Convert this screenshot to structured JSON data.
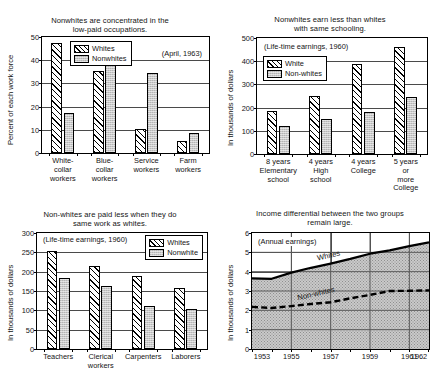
{
  "page": {
    "background": "#ffffff",
    "ink": "#000000",
    "shade": "#c9c9c9"
  },
  "charts": [
    {
      "id": "occupations",
      "chart_data": {
        "type": "bar",
        "title": "Nonwhites are concentrated in the\nlow-paid occupations.",
        "title_line1": "Nonwhites are concentrated in the",
        "title_line2": "low-paid occupations.",
        "note": "(April, 1963)",
        "xlabel": "",
        "ylabel": "Percent of each work force",
        "ylim": [
          0,
          50
        ],
        "yticks": [
          0,
          10,
          20,
          30,
          40,
          50
        ],
        "ytick_labels": [
          "0",
          "10",
          "20",
          "30",
          "40",
          "50"
        ],
        "grid": true,
        "legend_position": "inside-top-left",
        "categories": [
          "White-\ncollar\nworkers",
          "Blue-\ncollar\nworkers",
          "Service\nworkers",
          "Farm\nworkers"
        ],
        "series": [
          {
            "name": "Whites",
            "pattern": "hatch",
            "values": [
              47.5,
              35.4,
              10.5,
              5.3
            ]
          },
          {
            "name": "Nonwhites",
            "pattern": "stipple",
            "values": [
              17.4,
              40.1,
              34.3,
              8.6
            ]
          }
        ]
      }
    },
    {
      "id": "schooling",
      "chart_data": {
        "type": "bar",
        "title": "Nonwhites earn less than whites\nwith same schooling.",
        "title_line1": "Nonwhites earn less than whites",
        "title_line2": "with same schooling.",
        "note": "(Life-time earnings, 1960)",
        "xlabel": "",
        "ylabel": "In thousands of dollars",
        "ylim": [
          0,
          500
        ],
        "yticks": [
          0,
          100,
          200,
          300,
          400,
          500
        ],
        "ytick_labels": [
          "0",
          "100",
          "200",
          "300",
          "400",
          "500"
        ],
        "grid": true,
        "legend_position": "inside-left",
        "categories": [
          "8 years\nElementary\nschool",
          "4 years\nHigh\nschool",
          "4 years\nCollege",
          "5 years\nor more\nCollege"
        ],
        "series": [
          {
            "name": "White",
            "pattern": "hatch",
            "values": [
              187,
              250,
              388,
              463
            ]
          },
          {
            "name": "Non-whites",
            "pattern": "stipple",
            "values": [
              122,
              151,
              179,
              247
            ]
          }
        ]
      }
    },
    {
      "id": "samework",
      "chart_data": {
        "type": "bar",
        "title": "Non-whites are paid less when they do\nsame work as whites.",
        "title_line1": "Non-whites are paid less when they do",
        "title_line2": "same work as whites.",
        "note": "(Life-time earnings, 1960)",
        "xlabel": "",
        "ylabel": "In thousands of dollars",
        "ylim": [
          0,
          300
        ],
        "yticks": [
          0,
          50,
          100,
          150,
          200,
          250,
          300
        ],
        "ytick_labels": [
          "0",
          "50",
          "100",
          "150",
          "200",
          "250",
          "300"
        ],
        "grid": true,
        "legend_position": "inside-top-right",
        "categories": [
          "Teachers",
          "Clerical\nworkers",
          "Carpenters",
          "Laborers"
        ],
        "series": [
          {
            "name": "Whites",
            "pattern": "hatch",
            "values": [
              254,
              214,
              188,
              157
            ]
          },
          {
            "name": "Nonwhite",
            "pattern": "stipple",
            "values": [
              184,
              162,
              111,
              104
            ]
          }
        ]
      }
    },
    {
      "id": "differential",
      "chart_data": {
        "type": "line",
        "title": "Income differential between the two groups\nremain large.",
        "title_line1": "Income differential between the two groups",
        "title_line2": "remain large.",
        "note": "(Annual earnings)",
        "xlabel": "",
        "ylabel": "In thousands of dollars",
        "ylim": [
          0,
          6
        ],
        "yticks": [
          0,
          1,
          2,
          3,
          4,
          5,
          6
        ],
        "ytick_labels": [
          "0",
          "1",
          "2",
          "3",
          "4",
          "5",
          "6"
        ],
        "xlim": [
          1953,
          1962
        ],
        "xticks": [
          1953,
          1954,
          1955,
          1956,
          1957,
          1958,
          1959,
          1960,
          1961,
          1962
        ],
        "xtick_labels_shown": [
          "1953",
          "1955",
          "1957",
          "1959",
          "1961",
          "1962"
        ],
        "grid": true,
        "area_shaded_below_top_series": true,
        "x": [
          1953,
          1954,
          1955,
          1956,
          1957,
          1958,
          1959,
          1960,
          1961,
          1962
        ],
        "series": [
          {
            "name": "Whites",
            "style": "solid",
            "values": [
              3.65,
              3.63,
              3.95,
              4.2,
              4.42,
              4.66,
              4.93,
              5.1,
              5.32,
              5.52
            ]
          },
          {
            "name": "Non-whites",
            "style": "dashed",
            "values": [
              2.18,
              2.12,
              2.22,
              2.33,
              2.42,
              2.62,
              2.8,
              3.0,
              3.01,
              3.03
            ]
          }
        ]
      }
    }
  ]
}
